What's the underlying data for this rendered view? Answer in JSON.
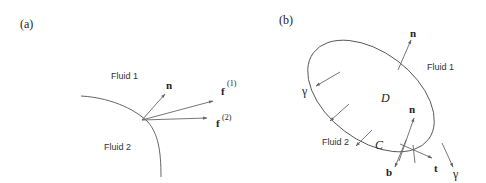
{
  "figure": {
    "panels": [
      {
        "id": "a",
        "label": "(a)",
        "region_labels": {
          "fluid1": "Fluid 1",
          "fluid2": "Fluid 2"
        },
        "vectors": {
          "normal": "n",
          "force1": "f",
          "force1_sup": "(1)",
          "force2": "f",
          "force2_sup": "(2)"
        }
      },
      {
        "id": "b",
        "label": "(b)",
        "region_labels": {
          "fluid1": "Fluid 1",
          "fluid2": "Fluid 2",
          "domain": "D",
          "contour": "C"
        },
        "vectors": {
          "normal_top": "n",
          "normal_inner": "n",
          "binormal": "b",
          "tangent": "t",
          "gamma_left": "γ",
          "gamma_right": "γ"
        }
      }
    ]
  }
}
